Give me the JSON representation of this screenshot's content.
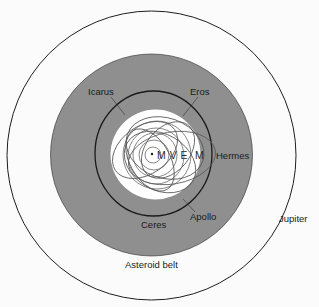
{
  "diagram": {
    "type": "solar-system-orbits",
    "colors": {
      "background": "#fbfbfb",
      "asteroid_belt_fill": "#8f8f8f",
      "inner_region_fill": "#ffffff",
      "orbit_stroke": "#1e1e1e",
      "asteroid_orbit_stroke": "#5a5a5a"
    },
    "center_glyph": "•",
    "planets_label": "M V E  M",
    "labels": {
      "icarus": "Icarus",
      "eros": "Eros",
      "hermes": "Hermes",
      "apollo": "Apollo",
      "ceres": "Ceres",
      "jupiter": "Jupiter",
      "asteroid_belt": "Asteroid belt"
    }
  }
}
